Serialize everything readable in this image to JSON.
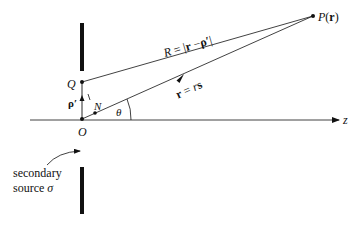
{
  "diagram": {
    "points": {
      "P": "P(r)",
      "Q": "Q",
      "O": "O",
      "N": "N"
    },
    "labels": {
      "R_eq_prefix": "R = |",
      "R_eq_r": "r",
      "R_eq_minus": " −",
      "R_eq_rho": "ρ′",
      "R_eq_suffix": "|",
      "r_eq_r": "r",
      "r_eq_mid": " = ",
      "r_eq_rs_r": "r",
      "r_eq_rs_s": "s",
      "rho_prime": "ρ′",
      "theta": "θ",
      "z_axis": "z",
      "P_letter": "P",
      "P_open": "(",
      "P_r": "r",
      "P_close": ")"
    },
    "annotation": {
      "line1": "secondary",
      "line2": "source ",
      "sigma": "σ"
    },
    "colors": {
      "ink": "#111111",
      "background": "#ffffff"
    }
  }
}
